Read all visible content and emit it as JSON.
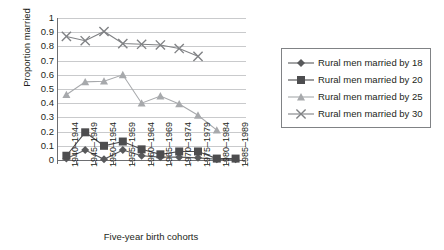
{
  "chart_data": {
    "type": "line",
    "title": "",
    "xlabel": "Five-year birth cohorts",
    "ylabel": "Proportion married",
    "ylim": [
      0,
      1
    ],
    "ytick_labels": [
      "1",
      "0.9",
      "0.8",
      "0.7",
      "0.6",
      "0.5",
      "0.4",
      "0.3",
      "0.2",
      "0.1",
      "0"
    ],
    "grid": true,
    "legend_position": "right",
    "categories": [
      "1940–1944",
      "1945–1949",
      "1950–1954",
      "1955–1959",
      "1960–1964",
      "1965–1969",
      "1970–1974",
      "1975–1979",
      "1980–1984",
      "1985–1989"
    ],
    "series": [
      {
        "name": "Rural men married by 18",
        "marker": "diamond",
        "color": "#58595b",
        "values": [
          0.01,
          0.07,
          0.005,
          0.07,
          0.03,
          0.02,
          0.02,
          0.015,
          0.005,
          0.005
        ]
      },
      {
        "name": "Rural men married by 20",
        "marker": "square",
        "color": "#4d4d4f",
        "values": [
          0.03,
          0.195,
          0.1,
          0.13,
          0.075,
          0.04,
          0.06,
          0.06,
          0.01,
          0.01
        ]
      },
      {
        "name": "Rural men married by 25",
        "marker": "triangle",
        "color": "#a7a9ac",
        "values": [
          0.46,
          0.55,
          0.555,
          0.6,
          0.4,
          0.45,
          0.395,
          0.315,
          0.21,
          null
        ]
      },
      {
        "name": "Rural men married by 30",
        "marker": "cross",
        "color": "#808285",
        "values": [
          0.87,
          0.84,
          0.905,
          0.82,
          0.815,
          0.81,
          0.785,
          0.73,
          null,
          null
        ]
      }
    ]
  }
}
